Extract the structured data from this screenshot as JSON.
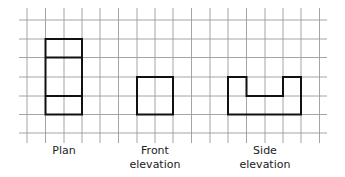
{
  "diagram": {
    "grid": {
      "x_lines": [
        27,
        45.5,
        64,
        82,
        100,
        118.5,
        137,
        155,
        173,
        191.5,
        210,
        228,
        246.5,
        265,
        283,
        301,
        319.5
      ],
      "y_lines": [
        20,
        39,
        57.5,
        77,
        96,
        114.5,
        133
      ],
      "x_start": 19,
      "x_end": 327,
      "y_start": 8,
      "y_end": 143,
      "color": "#9a9a9a"
    },
    "shapes": {
      "plan": {
        "label": "Plan",
        "outline": [
          [
            45.5,
            39
          ],
          [
            82,
            39
          ],
          [
            82,
            114.5
          ],
          [
            45.5,
            114.5
          ]
        ],
        "dividers": [
          57.5,
          96
        ]
      },
      "front": {
        "label_line1": "Front",
        "label_line2": "elevation",
        "outline": [
          [
            137,
            77
          ],
          [
            173,
            77
          ],
          [
            173,
            114.5
          ],
          [
            137,
            114.5
          ]
        ]
      },
      "side": {
        "label_line1": "Side",
        "label_line2": "elevation",
        "outline": [
          [
            228,
            77
          ],
          [
            246.5,
            77
          ],
          [
            246.5,
            96
          ],
          [
            283,
            96
          ],
          [
            283,
            77
          ],
          [
            301,
            77
          ],
          [
            301,
            114.5
          ],
          [
            228,
            114.5
          ]
        ]
      }
    },
    "line_color": "#111111"
  }
}
